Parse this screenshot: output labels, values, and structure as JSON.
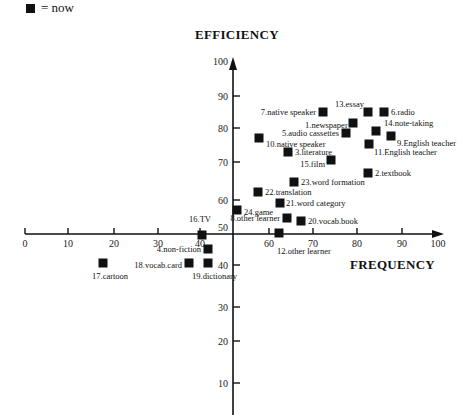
{
  "legend": {
    "symbol": "filled-square",
    "label": "= now"
  },
  "chart_data": {
    "type": "scatter",
    "title": "",
    "xlabel": "FREQUENCY",
    "ylabel": "EFFICIENCY",
    "xlim": [
      0,
      100
    ],
    "ylim": [
      0,
      100
    ],
    "x_ticks": [
      0,
      10,
      20,
      30,
      40,
      60,
      70,
      80,
      90,
      100
    ],
    "y_ticks": [
      10,
      20,
      30,
      40,
      50,
      60,
      70,
      80,
      90,
      100
    ],
    "axes_cross": {
      "x": 50,
      "y": 50
    },
    "grid": false,
    "legend": [
      {
        "marker": "square",
        "label": "now"
      }
    ],
    "points": [
      {
        "id": 1,
        "label": "1.newspaper",
        "x": 79,
        "y": 83
      },
      {
        "id": 2,
        "label": "2.textbook",
        "x": 83,
        "y": 68
      },
      {
        "id": 3,
        "label": "3.literature",
        "x": 63,
        "y": 74
      },
      {
        "id": 4,
        "label": "4.non-fiction",
        "x": 44,
        "y": 45
      },
      {
        "id": 5,
        "label": "5.audio cassettes",
        "x": 77,
        "y": 79
      },
      {
        "id": 6,
        "label": "6.radio",
        "x": 86,
        "y": 86
      },
      {
        "id": 7,
        "label": "7.native speaker",
        "x": 72,
        "y": 86
      },
      {
        "id": 8,
        "label": "8.other learner",
        "x": 63,
        "y": 55
      },
      {
        "id": 9,
        "label": "9.English teacher",
        "x": 88,
        "y": 78
      },
      {
        "id": 10,
        "label": "10.native speaker",
        "x": 56,
        "y": 78
      },
      {
        "id": 11,
        "label": "11.English teacher",
        "x": 83,
        "y": 76
      },
      {
        "id": 12,
        "label": "12.other learner",
        "x": 61,
        "y": 50
      },
      {
        "id": 13,
        "label": "13.essay",
        "x": 83,
        "y": 86
      },
      {
        "id": 14,
        "label": "14.note-taking",
        "x": 85,
        "y": 80
      },
      {
        "id": 15,
        "label": "15.film",
        "x": 74,
        "y": 72
      },
      {
        "id": 16,
        "label": "16.TV",
        "x": 42,
        "y": 50
      },
      {
        "id": 17,
        "label": "17.cartoon",
        "x": 19,
        "y": 42
      },
      {
        "id": 18,
        "label": "18.vocab.card",
        "x": 39,
        "y": 42
      },
      {
        "id": 19,
        "label": "19.dictionary",
        "x": 44,
        "y": 42
      },
      {
        "id": 20,
        "label": "20.vocab.book",
        "x": 67,
        "y": 54
      },
      {
        "id": 21,
        "label": "21.word category",
        "x": 61,
        "y": 59
      },
      {
        "id": 22,
        "label": "22.translation",
        "x": 56,
        "y": 62
      },
      {
        "id": 23,
        "label": "23.word formation",
        "x": 65,
        "y": 65
      },
      {
        "id": 24,
        "label": "24.game",
        "x": 51,
        "y": 57
      }
    ]
  },
  "plot": {
    "pixel_points": [
      {
        "px": 353,
        "py": 123,
        "lx": 305,
        "ly": 128,
        "anchor": "start",
        "lab": "1.newspaper"
      },
      {
        "px": 368,
        "py": 173,
        "lx": 375,
        "ly": 176,
        "anchor": "start",
        "lab": "2.textbook"
      },
      {
        "px": 288,
        "py": 152,
        "lx": 295,
        "ly": 155,
        "anchor": "start",
        "lab": "3.literature"
      },
      {
        "px": 208,
        "py": 249,
        "lx": 201,
        "ly": 252,
        "anchor": "end",
        "lab": "4.non-fiction"
      },
      {
        "px": 346,
        "py": 133,
        "lx": 339,
        "ly": 136,
        "anchor": "end",
        "lab": "5.audio cassettes"
      },
      {
        "px": 384,
        "py": 112,
        "lx": 391,
        "ly": 115,
        "anchor": "start",
        "lab": "6.radio"
      },
      {
        "px": 323,
        "py": 112,
        "lx": 316,
        "ly": 115,
        "anchor": "end",
        "lab": "7.native speaker"
      },
      {
        "px": 287,
        "py": 218,
        "lx": 280,
        "ly": 221,
        "anchor": "end",
        "lab": "8.other learner"
      },
      {
        "px": 391,
        "py": 136,
        "lx": 397,
        "ly": 146,
        "anchor": "start",
        "lab": "9.English teacher"
      },
      {
        "px": 259,
        "py": 138,
        "lx": 266,
        "ly": 147,
        "anchor": "start",
        "lab": "10.native speaker"
      },
      {
        "px": 369,
        "py": 144,
        "lx": 374,
        "ly": 155,
        "anchor": "start",
        "lab": "11.English teacher"
      },
      {
        "px": 279,
        "py": 233,
        "lx": 277,
        "ly": 254,
        "anchor": "start",
        "lab": "12.other learner"
      },
      {
        "px": 368,
        "py": 112,
        "lx": 364,
        "ly": 107,
        "anchor": "end",
        "lab": "13.essay"
      },
      {
        "px": 376,
        "py": 131,
        "lx": 384,
        "ly": 126,
        "anchor": "start",
        "lab": "14.note-taking"
      },
      {
        "px": 331,
        "py": 160,
        "lx": 325,
        "ly": 167,
        "anchor": "end",
        "lab": "15.film"
      },
      {
        "px": 202,
        "py": 235,
        "lx": 200,
        "ly": 222,
        "anchor": "middle",
        "lab": "16.TV"
      },
      {
        "px": 103,
        "py": 263,
        "lx": 92,
        "ly": 279,
        "anchor": "start",
        "lab": "17.cartoon"
      },
      {
        "px": 189,
        "py": 263,
        "lx": 182,
        "ly": 268,
        "anchor": "end",
        "lab": "18.vocab.card"
      },
      {
        "px": 208,
        "py": 263,
        "lx": 192,
        "ly": 279,
        "anchor": "start",
        "lab": "19.dictionary"
      },
      {
        "px": 301,
        "py": 221,
        "lx": 308,
        "ly": 224,
        "anchor": "start",
        "lab": "20.vocab.book"
      },
      {
        "px": 280,
        "py": 203,
        "lx": 286,
        "ly": 206,
        "anchor": "start",
        "lab": "21.word category"
      },
      {
        "px": 258,
        "py": 192,
        "lx": 265,
        "ly": 195,
        "anchor": "start",
        "lab": "22.translation"
      },
      {
        "px": 294,
        "py": 182,
        "lx": 301,
        "ly": 185,
        "anchor": "start",
        "lab": "23.word formation"
      },
      {
        "px": 237,
        "py": 210,
        "lx": 244,
        "ly": 215,
        "anchor": "start",
        "lab": "24.game"
      }
    ],
    "x_tick_px": [
      {
        "v": "0",
        "px": 25
      },
      {
        "v": "10",
        "px": 68
      },
      {
        "v": "20",
        "px": 114
      },
      {
        "v": "30",
        "px": 158
      },
      {
        "v": "40",
        "px": 200
      },
      {
        "v": "60",
        "px": 269
      },
      {
        "v": "70",
        "px": 313
      },
      {
        "v": "80",
        "px": 357
      },
      {
        "v": "90",
        "px": 402
      }
    ],
    "y_tick_px": [
      {
        "v": "90",
        "py": 96
      },
      {
        "v": "80",
        "py": 128
      },
      {
        "v": "70",
        "py": 162
      },
      {
        "v": "60",
        "py": 200
      },
      {
        "v": "40",
        "py": 265
      },
      {
        "v": "30",
        "py": 307
      },
      {
        "v": "20",
        "py": 341
      },
      {
        "v": "10",
        "py": 383
      }
    ],
    "y_top_label": "100",
    "x_end_label": "100",
    "center_label": "50"
  }
}
